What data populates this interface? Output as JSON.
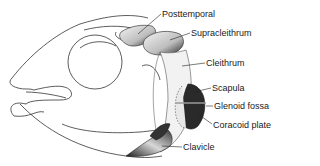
{
  "figure": {
    "labels": [
      {
        "id": "posttemporal",
        "text": "Posttemporal",
        "x": 162,
        "y": 10
      },
      {
        "id": "supracleithrum",
        "text": "Supracleithrum",
        "x": 191,
        "y": 29
      },
      {
        "id": "cleithrum",
        "text": "Cleithrum",
        "x": 206,
        "y": 59
      },
      {
        "id": "scapula",
        "text": "Scapula",
        "x": 212,
        "y": 84
      },
      {
        "id": "glenoid-fossa",
        "text": "Glenoid fossa",
        "x": 214,
        "y": 102
      },
      {
        "id": "coracoid-plate",
        "text": "Coracoid plate",
        "x": 213,
        "y": 121
      },
      {
        "id": "clavicle",
        "text": "Clavicle",
        "x": 183,
        "y": 143
      }
    ]
  }
}
